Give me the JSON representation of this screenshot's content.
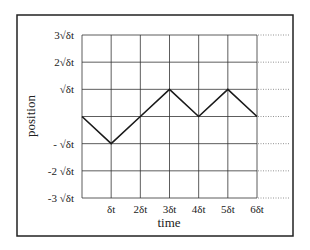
{
  "chart_data": {
    "type": "line",
    "title": "",
    "xlabel": "time",
    "ylabel": "position",
    "x_unit": "δt",
    "y_unit": "√δt",
    "x": [
      0,
      1,
      2,
      3,
      4,
      5,
      6
    ],
    "series": [
      {
        "name": "random walk",
        "values": [
          0,
          -1,
          0,
          1,
          0,
          1,
          0
        ]
      }
    ],
    "xlim": [
      0,
      6
    ],
    "ylim": [
      -3,
      3
    ],
    "grid": true,
    "x_ticks": [
      {
        "value": 1,
        "label": "δt"
      },
      {
        "value": 2,
        "label": "2δt"
      },
      {
        "value": 3,
        "label": "3δt"
      },
      {
        "value": 4,
        "label": "4δt"
      },
      {
        "value": 5,
        "label": "5δt"
      },
      {
        "value": 6,
        "label": "6δt"
      }
    ],
    "y_ticks": [
      {
        "value": 3,
        "label": "3√δt"
      },
      {
        "value": 2,
        "label": "2√δt"
      },
      {
        "value": 1,
        "label": "√δt"
      },
      {
        "value": -1,
        "label": "- √δt"
      },
      {
        "value": -2,
        "label": "-2 √δt"
      },
      {
        "value": -3,
        "label": "-3 √δt"
      }
    ],
    "dotted_extensions": [
      3,
      2,
      1,
      0,
      -1,
      -2,
      -3
    ],
    "colors": {
      "line": "#1a1a1a",
      "grid": "#333333",
      "frame": "#222222"
    }
  }
}
